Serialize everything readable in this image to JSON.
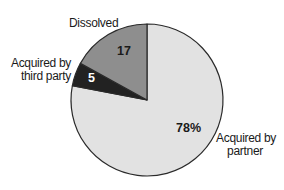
{
  "chart_data": {
    "type": "pie",
    "title": "",
    "start_angle_deg": 0,
    "direction": "counterclockwise-from-top for small slices; large slice fills remainder",
    "slices": [
      {
        "name": "Acquired by partner",
        "label_lines": [
          "Acquired by",
          "partner"
        ],
        "value": 78,
        "display_value": "78%",
        "color": "#e2e2e2"
      },
      {
        "name": "Dissolved",
        "label_lines": [
          "Dissolved"
        ],
        "value": 17,
        "display_value": "17",
        "color": "#8e8e8e"
      },
      {
        "name": "Acquired by third party",
        "label_lines": [
          "Acquired by",
          "third party"
        ],
        "value": 5,
        "display_value": "5",
        "color": "#222222"
      }
    ],
    "categories": [
      "Acquired by partner",
      "Dissolved",
      "Acquired by third party"
    ],
    "values": [
      78,
      17,
      5
    ],
    "unit": "%",
    "legend": "none (direct labels)",
    "outline_color": "#2a2a2a"
  },
  "labels": {
    "partner_line1": "Acquired by",
    "partner_line2": "partner",
    "partner_value": "78%",
    "dissolved": "Dissolved",
    "dissolved_value": "17",
    "third_line1": "Acquired by",
    "third_line2": "third party",
    "third_value": "5"
  }
}
